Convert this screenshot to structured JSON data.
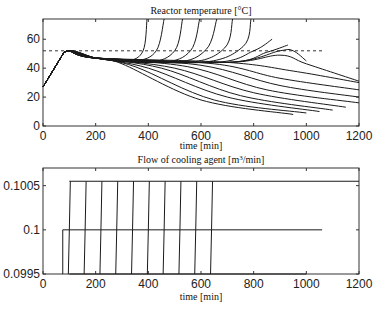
{
  "chart_data": [
    {
      "type": "line",
      "title": "Reactor temperature [°C]",
      "xlabel": "time [min]",
      "ylabel": "",
      "xlim": [
        0,
        1200
      ],
      "ylim": [
        0,
        74
      ],
      "xticks": [
        "0",
        "200",
        "400",
        "600",
        "800",
        "1000",
        "1200"
      ],
      "yticks": [
        "0",
        "20",
        "40",
        "60"
      ],
      "grid": false,
      "reference_line": {
        "y": 52,
        "x_range": [
          0,
          1060
        ],
        "style": "dashed"
      },
      "series_description": "Family of ~20 temperature trajectories: common heat-up from 27°C at t=0 to ~51°C at t≈80, slow decline to ~45°C; runaway branches rise steeply above 74°C at t≈395,460,530,595,660,720,790; later branches peak near 52-56°C around t≈870-950 then fall; lower branches decay to ~8-30°C by t=1000-1200.",
      "series": [
        {
          "name": "runaway-1",
          "x": [
            0,
            80,
            200,
            320,
            380,
            395
          ],
          "y": [
            27,
            51,
            47,
            45,
            52,
            74
          ]
        },
        {
          "name": "runaway-2",
          "x": [
            0,
            80,
            200,
            350,
            430,
            460
          ],
          "y": [
            27,
            51,
            47,
            45,
            52,
            74
          ]
        },
        {
          "name": "runaway-3",
          "x": [
            0,
            80,
            200,
            400,
            500,
            530
          ],
          "y": [
            27,
            51,
            47,
            44,
            52,
            74
          ]
        },
        {
          "name": "runaway-4",
          "x": [
            0,
            80,
            200,
            450,
            560,
            595
          ],
          "y": [
            27,
            51,
            47,
            44,
            52,
            74
          ]
        },
        {
          "name": "runaway-5",
          "x": [
            0,
            80,
            200,
            500,
            620,
            660
          ],
          "y": [
            27,
            51,
            47,
            44,
            53,
            74
          ]
        },
        {
          "name": "runaway-6",
          "x": [
            0,
            80,
            200,
            550,
            690,
            720
          ],
          "y": [
            27,
            51,
            47,
            44,
            54,
            74
          ]
        },
        {
          "name": "runaway-7",
          "x": [
            0,
            80,
            200,
            600,
            760,
            790
          ],
          "y": [
            27,
            51,
            47,
            44,
            55,
            74
          ]
        },
        {
          "name": "peak-1",
          "x": [
            0,
            80,
            200,
            650,
            800,
            870
          ],
          "y": [
            27,
            51,
            47,
            44,
            52,
            60
          ]
        },
        {
          "name": "peak-2",
          "x": [
            0,
            80,
            200,
            700,
            850,
            930
          ],
          "y": [
            27,
            51,
            47,
            44,
            51,
            56
          ]
        },
        {
          "name": "peak-3",
          "x": [
            0,
            80,
            200,
            700,
            900,
            950,
            1000
          ],
          "y": [
            27,
            51,
            47,
            44,
            52,
            52,
            45
          ]
        },
        {
          "name": "peak-4",
          "x": [
            0,
            80,
            200,
            700,
            900,
            1000,
            1200
          ],
          "y": [
            27,
            51,
            47,
            44,
            49,
            43,
            31
          ]
        },
        {
          "name": "decay-1",
          "x": [
            0,
            80,
            200,
            700,
            950,
            1200
          ],
          "y": [
            27,
            51,
            47,
            44,
            38,
            30
          ]
        },
        {
          "name": "decay-2",
          "x": [
            0,
            80,
            200,
            650,
            900,
            1200
          ],
          "y": [
            27,
            51,
            47,
            43,
            33,
            25
          ]
        },
        {
          "name": "decay-3",
          "x": [
            0,
            80,
            200,
            600,
            900,
            1200
          ],
          "y": [
            27,
            51,
            47,
            42,
            28,
            20
          ]
        },
        {
          "name": "decay-4",
          "x": [
            0,
            80,
            200,
            550,
            850,
            1200
          ],
          "y": [
            27,
            51,
            47,
            41,
            25,
            16
          ]
        },
        {
          "name": "decay-5",
          "x": [
            0,
            80,
            200,
            500,
            800,
            1150
          ],
          "y": [
            27,
            51,
            47,
            40,
            23,
            13
          ]
        },
        {
          "name": "decay-6",
          "x": [
            0,
            80,
            200,
            450,
            750,
            1100
          ],
          "y": [
            27,
            51,
            47,
            40,
            21,
            11
          ]
        },
        {
          "name": "decay-7",
          "x": [
            0,
            80,
            200,
            400,
            700,
            1050
          ],
          "y": [
            27,
            51,
            47,
            40,
            20,
            10
          ]
        },
        {
          "name": "decay-8",
          "x": [
            0,
            80,
            200,
            350,
            650,
            1000
          ],
          "y": [
            27,
            51,
            47,
            41,
            18,
            9
          ]
        },
        {
          "name": "decay-9",
          "x": [
            0,
            80,
            200,
            300,
            600,
            950
          ],
          "y": [
            27,
            51,
            47,
            43,
            18,
            8
          ]
        }
      ]
    },
    {
      "type": "line",
      "title": "Flow of cooling agent [m³/min]",
      "xlabel": "time [min]",
      "ylabel": "",
      "xlim": [
        0,
        1200
      ],
      "ylim": [
        0.0995,
        0.1007
      ],
      "xticks": [
        "0",
        "200",
        "400",
        "600",
        "800",
        "1000",
        "1200"
      ],
      "yticks": [
        "0.0995",
        "0.1",
        "0.1005"
      ],
      "grid": false,
      "series_description": "Step profiles: one step from 0.0995 to 0.1 at t≈75 held until t≈1060; step-ups from 0.0995 to 0.10055 at t≈100,160,220,280,340,400,460,520,580,640 held to t=1200; lower baseline 0.0995 from t≈100 to 1000.",
      "series": [
        {
          "name": "mid-step",
          "x": [
            75,
            75,
            1060
          ],
          "y": [
            0.0995,
            0.1,
            0.1
          ]
        },
        {
          "name": "upper-level",
          "x": [
            100,
            1200
          ],
          "y": [
            0.10055,
            0.10055
          ]
        },
        {
          "name": "lower-level",
          "x": [
            100,
            1000
          ],
          "y": [
            0.0995,
            0.0995
          ]
        },
        {
          "name": "step-times",
          "x": [
            100,
            160,
            220,
            280,
            340,
            400,
            460,
            520,
            580,
            640
          ],
          "y": [
            0.10055,
            0.10055,
            0.10055,
            0.10055,
            0.10055,
            0.10055,
            0.10055,
            0.10055,
            0.10055,
            0.10055
          ]
        }
      ]
    }
  ],
  "top": {
    "title": "Reactor temperature [°C]",
    "xlabel": "time [min]",
    "xticks": [
      "0",
      "200",
      "400",
      "600",
      "800",
      "1000",
      "1200"
    ],
    "yticks": [
      "0",
      "20",
      "40",
      "60"
    ]
  },
  "bottom": {
    "title_pre": "Flow of cooling agent [m",
    "title_sup": "3",
    "title_post": "/min]",
    "xlabel": "time [min]",
    "xticks": [
      "0",
      "200",
      "400",
      "600",
      "800",
      "1000",
      "1200"
    ],
    "yticks": [
      "0.0995",
      "0.1",
      "0.1005"
    ]
  },
  "colors": {
    "line": "#1a1a1a",
    "axis": "#333333",
    "background": "#ffffff"
  }
}
